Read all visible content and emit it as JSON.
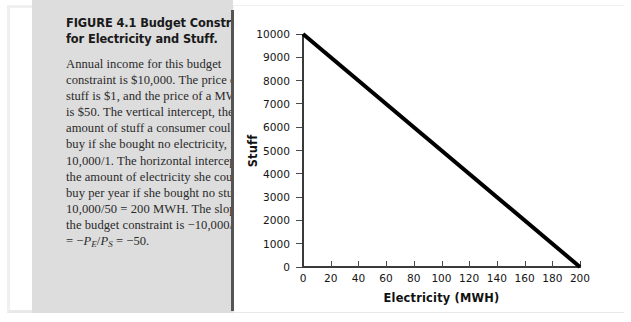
{
  "figure": {
    "label": "FIGURE 4.1",
    "title": "Budget Constraint for Electricity and Stuff.",
    "caption": "Annual income for this budget constraint is $10,000. The price of stuff is $1, and the price of a MWH is $50. The vertical intercept, the amount of stuff a consumer could buy if she bought no electricity, is 10,000/1. The horizontal intercept, the amount of electricity she could buy per year if she bought no stuff, is 10,000/50 = 200 MWH. The slope of the budget constraint is",
    "formula_lead": "−10,000/200 = −",
    "formula_var1": "P",
    "formula_sub1": "E",
    "formula_slash": "/",
    "formula_var2": "P",
    "formula_sub2": "S",
    "formula_tail": " = −50."
  },
  "colors": {
    "panel_background": "#dddddd",
    "divider": "#555555",
    "axis": "#3a3a3a",
    "line": "#000000",
    "page_background": "#ffffff",
    "text": "#2a2a2a"
  },
  "chart_data": {
    "type": "line",
    "title": "",
    "xlabel": "Electricity (MWH)",
    "ylabel": "Stuff",
    "xlim": [
      0,
      200
    ],
    "ylim": [
      0,
      10000
    ],
    "xticks": [
      0,
      20,
      40,
      60,
      80,
      100,
      120,
      140,
      160,
      180,
      200
    ],
    "yticks": [
      0,
      1000,
      2000,
      3000,
      4000,
      5000,
      6000,
      7000,
      8000,
      9000,
      10000
    ],
    "xtick_labels": [
      "0",
      "20",
      "40",
      "60",
      "80",
      "100",
      "120",
      "140",
      "160",
      "180",
      "200"
    ],
    "ytick_labels": [
      "0",
      "1000",
      "2000",
      "3000",
      "4000",
      "5000",
      "6000",
      "7000",
      "8000",
      "9000",
      "10000"
    ],
    "grid": false,
    "legend": null,
    "series": [
      {
        "name": "Budget constraint",
        "x": [
          0,
          200
        ],
        "y": [
          10000,
          0
        ],
        "slope": -50,
        "vertical_intercept": 10000,
        "horizontal_intercept": 200,
        "color": "#000000",
        "linewidth": 4
      }
    ]
  }
}
